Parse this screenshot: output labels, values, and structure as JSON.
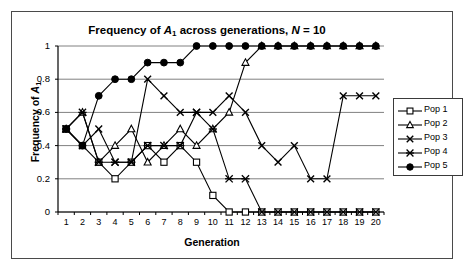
{
  "chart_data": {
    "type": "line",
    "title": "Frequency of A1 across generations, N = 10",
    "title_parts": {
      "pre": "Frequency of ",
      "allele": "A",
      "allele_sub": "1",
      "mid": " across generations, ",
      "n_symbol": "N",
      "n_value": " = 10"
    },
    "xlabel": "Generation",
    "ylabel": "Frequency of A1",
    "ylabel_parts": {
      "pre": "Frequency of ",
      "allele": "A",
      "allele_sub": "1"
    },
    "x": [
      1,
      2,
      3,
      4,
      5,
      6,
      7,
      8,
      9,
      10,
      11,
      12,
      13,
      14,
      15,
      16,
      17,
      18,
      19,
      20
    ],
    "xtick_labels": [
      "1",
      "2",
      "3",
      "4",
      "5",
      "6",
      "7",
      "8",
      "9",
      "10",
      "11",
      "12",
      "13",
      "14",
      "15",
      "16",
      "17",
      "18",
      "19",
      "20"
    ],
    "ytick_labels": [
      "1",
      "0.8",
      "0.6",
      "0.4",
      "0.2",
      "0"
    ],
    "ytick_values": [
      1,
      0.8,
      0.6,
      0.4,
      0.2,
      0
    ],
    "xlim": [
      0.5,
      20.5
    ],
    "ylim": [
      0,
      1
    ],
    "grid": "horizontal",
    "legend_position": "right",
    "series": [
      {
        "name": "Pop 1",
        "marker": "open-square",
        "color": "#000000",
        "values": [
          0.5,
          0.4,
          0.3,
          0.2,
          0.3,
          0.4,
          0.3,
          0.4,
          0.3,
          0.1,
          0,
          0,
          0,
          0,
          0,
          0,
          0,
          0,
          0,
          0
        ]
      },
      {
        "name": "Pop 2",
        "marker": "open-triangle",
        "color": "#000000",
        "values": [
          0.5,
          0.6,
          0.3,
          0.4,
          0.5,
          0.3,
          0.4,
          0.5,
          0.4,
          0.5,
          0.6,
          0.9,
          1,
          1,
          1,
          1,
          1,
          1,
          1,
          1
        ]
      },
      {
        "name": "Pop 3",
        "marker": "cross-x",
        "color": "#000000",
        "values": [
          0.5,
          0.4,
          0.5,
          0.3,
          0.3,
          0.8,
          0.7,
          0.6,
          0.6,
          0.6,
          0.7,
          0.6,
          0.4,
          0.3,
          0.4,
          0.2,
          0.2,
          0.7,
          0.7,
          0.7
        ]
      },
      {
        "name": "Pop 4",
        "marker": "asterisk",
        "color": "#000000",
        "values": [
          0.5,
          0.6,
          0.3,
          0.3,
          0.3,
          0.4,
          0.4,
          0.4,
          0.6,
          0.5,
          0.2,
          0.2,
          0,
          0,
          0,
          0,
          0,
          0,
          0,
          0
        ]
      },
      {
        "name": "Pop 5",
        "marker": "filled-circle",
        "color": "#000000",
        "values": [
          0.5,
          0.4,
          0.7,
          0.8,
          0.8,
          0.9,
          0.9,
          0.9,
          1,
          1,
          1,
          1,
          1,
          1,
          1,
          1,
          1,
          1,
          1,
          1
        ]
      }
    ]
  },
  "legend": {
    "items": [
      {
        "label": "Pop 1"
      },
      {
        "label": "Pop 2"
      },
      {
        "label": "Pop 3"
      },
      {
        "label": "Pop 4"
      },
      {
        "label": "Pop 5"
      }
    ]
  }
}
